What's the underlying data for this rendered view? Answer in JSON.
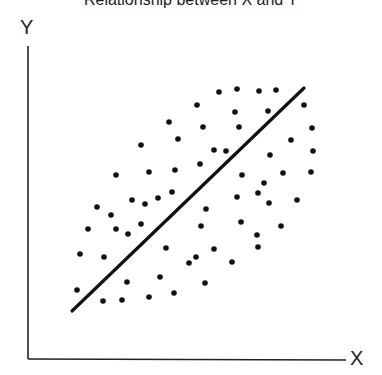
{
  "chart_data": {
    "type": "scatter",
    "title": "Relationship between X and Y",
    "xlabel": "X",
    "ylabel": "Y",
    "grid": false,
    "legend": null,
    "ticks": {
      "x": [],
      "y": []
    },
    "note": "Axes have no numeric ticks; points given in pixel coordinates (x right, y down) within a 382x375 canvas. Axis origin at (28, 359).",
    "axes": {
      "origin": [
        28,
        359
      ],
      "x_axis_end": [
        346,
        360
      ],
      "y_axis_top": [
        28,
        46
      ]
    },
    "trend_line": {
      "type": "linear",
      "from": [
        72,
        311
      ],
      "to": [
        304,
        88
      ],
      "direction": "positive"
    },
    "points": [
      [
        219,
        92
      ],
      [
        237,
        89
      ],
      [
        259,
        91
      ],
      [
        276,
        90
      ],
      [
        197,
        105
      ],
      [
        235,
        112
      ],
      [
        268,
        111
      ],
      [
        304,
        105
      ],
      [
        169,
        122
      ],
      [
        203,
        127
      ],
      [
        239,
        127
      ],
      [
        312,
        128
      ],
      [
        178,
        139
      ],
      [
        141,
        145
      ],
      [
        291,
        140
      ],
      [
        214,
        150
      ],
      [
        226,
        151
      ],
      [
        270,
        155
      ],
      [
        313,
        151
      ],
      [
        200,
        164
      ],
      [
        242,
        175
      ],
      [
        283,
        173
      ],
      [
        311,
        172
      ],
      [
        116,
        175
      ],
      [
        149,
        172
      ],
      [
        175,
        170
      ],
      [
        264,
        183
      ],
      [
        258,
        193
      ],
      [
        237,
        197
      ],
      [
        269,
        203
      ],
      [
        297,
        200
      ],
      [
        132,
        200
      ],
      [
        145,
        204
      ],
      [
        158,
        198
      ],
      [
        172,
        192
      ],
      [
        97,
        207
      ],
      [
        111,
        215
      ],
      [
        206,
        209
      ],
      [
        88,
        229
      ],
      [
        116,
        229
      ],
      [
        128,
        234
      ],
      [
        141,
        224
      ],
      [
        201,
        226
      ],
      [
        241,
        222
      ],
      [
        257,
        235
      ],
      [
        258,
        247
      ],
      [
        281,
        226
      ],
      [
        80,
        254
      ],
      [
        104,
        257
      ],
      [
        166,
        248
      ],
      [
        214,
        249
      ],
      [
        189,
        263
      ],
      [
        196,
        257
      ],
      [
        232,
        262
      ],
      [
        127,
        282
      ],
      [
        160,
        277
      ],
      [
        205,
        283
      ],
      [
        77,
        290
      ],
      [
        149,
        297
      ],
      [
        174,
        293
      ],
      [
        103,
        301
      ],
      [
        122,
        300
      ]
    ],
    "colors": {
      "points": "#111111",
      "line": "#111111",
      "axes": "#222222",
      "background": "#ffffff"
    }
  }
}
